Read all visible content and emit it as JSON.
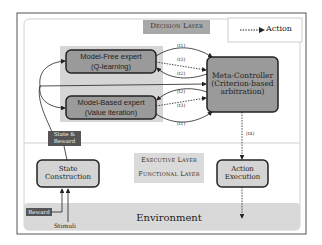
{
  "legend": {
    "action_label": "Action"
  },
  "layers": {
    "decision": "Decision Layer",
    "executive": "Executive Layer",
    "functional": "Functional Layer",
    "environment": "Environment"
  },
  "nodes": {
    "model_free": {
      "line1": "Model-Free expert",
      "line2": "(Q-learning)"
    },
    "model_based": {
      "line1": "Model-Based expert",
      "line2": "(Value iteration)"
    },
    "meta_controller": {
      "line1": "Meta-Controller",
      "line2": "(Criterion-based",
      "line3": "arbitration)"
    },
    "state_construction": {
      "line1": "State",
      "line2": "Construction"
    },
    "action_execution": {
      "line1": "Action",
      "line2": "Execution"
    }
  },
  "tags": {
    "state_reward": {
      "line1": "State &",
      "line2": "Reward"
    },
    "reward": "Reward",
    "stimuli": "Stimuli"
  },
  "edges": {
    "mf_t1": "(t1)",
    "mf_t3": "(t3)",
    "mf_t2": "(t2)",
    "mb_t2": "(t2)",
    "mb_t3": "(t3)",
    "mb_t1": "(t1)",
    "action_t4": "(t4)"
  },
  "colors": {
    "node_fill": "#9a9a9a",
    "node_light_fill": "#d4d4d4",
    "highlight": "#d6d6d6",
    "tag_fill": "#555555",
    "environment_fill": "#d9d9d9",
    "border": "#222222"
  }
}
